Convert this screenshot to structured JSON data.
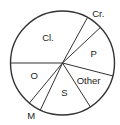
{
  "chart_data": {
    "type": "pie",
    "title": "",
    "start_angle_deg_clockwise_from_top": -90,
    "slices": [
      {
        "label": "Cl.",
        "value": 33
      },
      {
        "label": "Cr.",
        "value": 5
      },
      {
        "label": "P",
        "value": 16
      },
      {
        "label": "Other",
        "value": 12
      },
      {
        "label": "S",
        "value": 16
      },
      {
        "label": "M",
        "value": 4
      },
      {
        "label": "O",
        "value": 14
      }
    ],
    "legend": "none"
  }
}
